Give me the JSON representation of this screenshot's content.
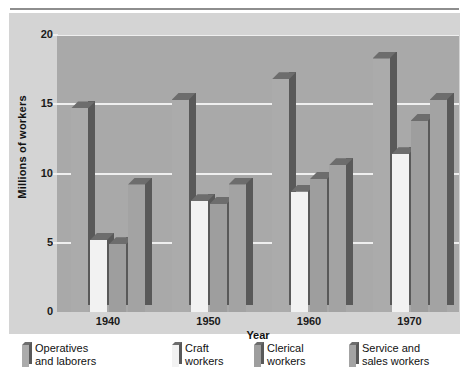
{
  "figure": {
    "cropped_title_remnant": "",
    "y_axis_title": "Millions of workers",
    "x_axis_title": "Year"
  },
  "chart_data": {
    "type": "bar",
    "title": "",
    "xlabel": "Year",
    "ylabel": "Millions of workers",
    "categories": [
      "1940",
      "1950",
      "1960",
      "1970"
    ],
    "ylim": [
      0,
      20
    ],
    "yticks": [
      0,
      5,
      10,
      15,
      20
    ],
    "grid": true,
    "legend_position": "below",
    "series": [
      {
        "name": "Operatives and laborers",
        "color": "#ababab",
        "values": [
          14.7,
          15.3,
          16.8,
          18.3
        ]
      },
      {
        "name": "Craft workers",
        "color": "#f2f2f2",
        "values": [
          5.2,
          8.0,
          8.7,
          11.4
        ]
      },
      {
        "name": "Clerical workers",
        "color": "#9e9e9e",
        "values": [
          4.9,
          7.8,
          9.6,
          13.8
        ]
      },
      {
        "name": "Service and sales workers",
        "color": "#a3a3a3",
        "values": [
          9.2,
          9.2,
          10.6,
          15.3
        ]
      }
    ]
  },
  "legend": {
    "items": [
      {
        "label": "Operatives\nand laborers",
        "color": "#ababab"
      },
      {
        "label": "Craft\nworkers",
        "color": "#f2f2f2"
      },
      {
        "label": "Clerical\nworkers",
        "color": "#9e9e9e"
      },
      {
        "label": "Service and\nsales workers",
        "color": "#a3a3a3"
      }
    ]
  },
  "colors": {
    "page_background": "#ffffff",
    "chart_background": "#d4d4d4",
    "plot_background": "#a9a9a9",
    "gridline": "#efefef",
    "bar_side_shadow": "#595959",
    "bar_top": "#6d6d6d",
    "text": "#111111"
  }
}
